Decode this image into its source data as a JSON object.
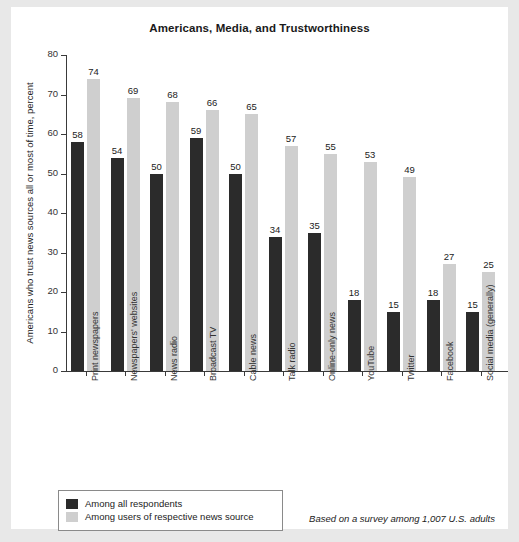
{
  "chart_data": {
    "type": "bar",
    "title": "Americans, Media, and Trustworthiness",
    "xlabel": "",
    "ylabel": "Americans who trust news sources all or most of time, percent",
    "ylim": [
      0,
      80
    ],
    "yticks": [
      0,
      10,
      20,
      30,
      40,
      50,
      60,
      70,
      80
    ],
    "grid": false,
    "legend_position": "bottom-left",
    "categories": [
      "Print newspapers",
      "Newspapers' websites",
      "News radio",
      "Broadcast TV",
      "Cable news",
      "Talk radio",
      "Online-only news",
      "YouTube",
      "Twitter",
      "Facebook",
      "Social media (generally)"
    ],
    "series": [
      {
        "name": "Among all respondents",
        "color": "#2b2b2b",
        "values": [
          58,
          54,
          50,
          59,
          50,
          34,
          35,
          18,
          15,
          18,
          15
        ]
      },
      {
        "name": "Among users of respective news source",
        "color": "#cfcfcf",
        "values": [
          74,
          69,
          68,
          66,
          65,
          57,
          55,
          53,
          49,
          27,
          25
        ]
      }
    ],
    "annotation": "Based on a survey among 1,007 U.S. adults"
  },
  "legend": {
    "items": [
      {
        "label": "Among all respondents",
        "swatch": "dark"
      },
      {
        "label": "Among users of respective news source",
        "swatch": "light"
      }
    ]
  }
}
